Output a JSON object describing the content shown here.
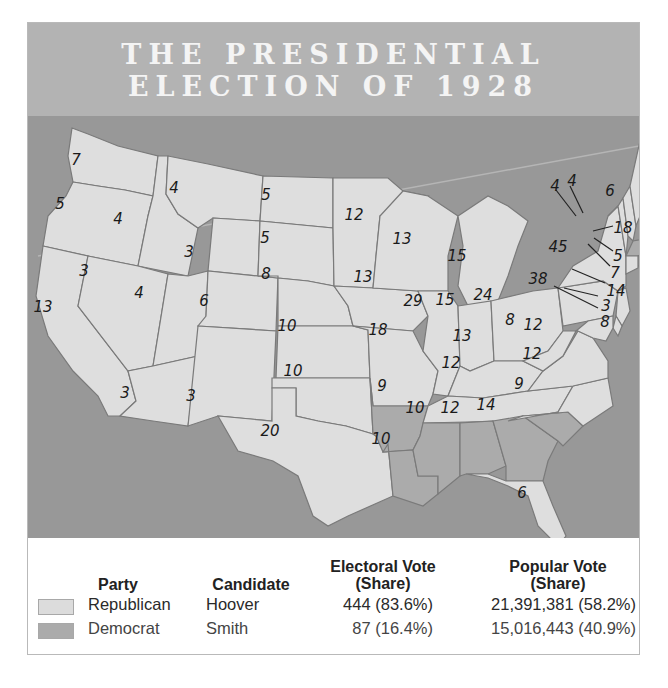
{
  "title": {
    "line1": "THE PRESIDENTIAL",
    "line2": "ELECTION OF 1928"
  },
  "colors": {
    "title_band": "#b3b3b3",
    "water": "#989898",
    "republican": "#dedede",
    "democrat": "#ababab",
    "state_border": "#7a7a7a"
  },
  "map": {
    "states": [
      {
        "id": "WA",
        "votes": "7",
        "party": "Republican"
      },
      {
        "id": "OR",
        "votes": "5",
        "party": "Republican"
      },
      {
        "id": "CA",
        "votes": "13",
        "party": "Republican"
      },
      {
        "id": "ID",
        "votes": "4",
        "party": "Republican"
      },
      {
        "id": "NV",
        "votes": "3",
        "party": "Republican"
      },
      {
        "id": "MT",
        "votes": "4",
        "party": "Republican"
      },
      {
        "id": "WY",
        "votes": "3",
        "party": "Republican"
      },
      {
        "id": "UT",
        "votes": "4",
        "party": "Republican"
      },
      {
        "id": "AZ",
        "votes": "3",
        "party": "Republican"
      },
      {
        "id": "CO",
        "votes": "6",
        "party": "Republican"
      },
      {
        "id": "NM",
        "votes": "3",
        "party": "Republican"
      },
      {
        "id": "ND",
        "votes": "5",
        "party": "Republican"
      },
      {
        "id": "SD",
        "votes": "5",
        "party": "Republican"
      },
      {
        "id": "NE",
        "votes": "8",
        "party": "Republican"
      },
      {
        "id": "KS",
        "votes": "10",
        "party": "Republican"
      },
      {
        "id": "OK",
        "votes": "10",
        "party": "Republican"
      },
      {
        "id": "TX",
        "votes": "20",
        "party": "Republican"
      },
      {
        "id": "MN",
        "votes": "12",
        "party": "Republican"
      },
      {
        "id": "IA",
        "votes": "13",
        "party": "Republican"
      },
      {
        "id": "MO",
        "votes": "18",
        "party": "Republican"
      },
      {
        "id": "AR",
        "votes": "9",
        "party": "Democrat"
      },
      {
        "id": "LA",
        "votes": "10",
        "party": "Democrat"
      },
      {
        "id": "WI",
        "votes": "13",
        "party": "Republican"
      },
      {
        "id": "IL",
        "votes": "29",
        "party": "Republican"
      },
      {
        "id": "MI",
        "votes": "15",
        "party": "Republican"
      },
      {
        "id": "IN",
        "votes": "15",
        "party": "Republican"
      },
      {
        "id": "OH",
        "votes": "24",
        "party": "Republican"
      },
      {
        "id": "KY",
        "votes": "13",
        "party": "Republican"
      },
      {
        "id": "TN",
        "votes": "12",
        "party": "Republican"
      },
      {
        "id": "MS",
        "votes": "10",
        "party": "Democrat"
      },
      {
        "id": "AL",
        "votes": "12",
        "party": "Democrat"
      },
      {
        "id": "GA",
        "votes": "14",
        "party": "Democrat"
      },
      {
        "id": "FL",
        "votes": "6",
        "party": "Republican"
      },
      {
        "id": "SC",
        "votes": "9",
        "party": "Democrat"
      },
      {
        "id": "NC",
        "votes": "12",
        "party": "Republican"
      },
      {
        "id": "VA",
        "votes": "12",
        "party": "Republican"
      },
      {
        "id": "WV",
        "votes": "8",
        "party": "Republican"
      },
      {
        "id": "PA",
        "votes": "38",
        "party": "Republican"
      },
      {
        "id": "NY",
        "votes": "45",
        "party": "Republican"
      },
      {
        "id": "VT",
        "votes": "4",
        "party": "Republican"
      },
      {
        "id": "NH",
        "votes": "4",
        "party": "Republican"
      },
      {
        "id": "ME",
        "votes": "6",
        "party": "Republican"
      },
      {
        "id": "MA",
        "votes": "18",
        "party": "Democrat"
      },
      {
        "id": "RI",
        "votes": "5",
        "party": "Democrat"
      },
      {
        "id": "CT",
        "votes": "7",
        "party": "Republican"
      },
      {
        "id": "NJ",
        "votes": "14",
        "party": "Republican"
      },
      {
        "id": "DE",
        "votes": "3",
        "party": "Republican"
      },
      {
        "id": "MD",
        "votes": "8",
        "party": "Republican"
      }
    ]
  },
  "legend": {
    "headers": {
      "party": "Party",
      "candidate": "Candidate",
      "electoral_1": "Electoral Vote",
      "electoral_2": "(Share)",
      "popular_1": "Popular Vote",
      "popular_2": "(Share)"
    },
    "rows": [
      {
        "party": "Republican",
        "candidate": "Hoover",
        "electoral": "444 (83.6%)",
        "popular": "21,391,381 (58.2%)",
        "swatch": "#dcdcdc"
      },
      {
        "party": "Democrat",
        "candidate": "Smith",
        "electoral": "87 (16.4%)",
        "popular": "15,016,443 (40.9%)",
        "swatch": "#ababab"
      }
    ]
  }
}
